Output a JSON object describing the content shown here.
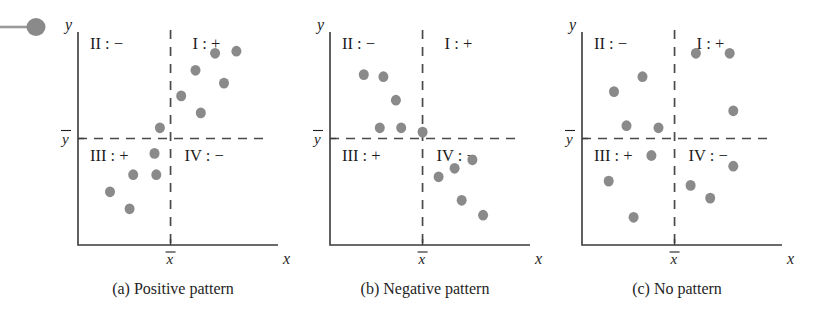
{
  "figure": {
    "dot_color": "#8a8a8a",
    "axis_color": "#3a3a3a",
    "mean_line_color": "#4a4a4a",
    "background": "#ffffff",
    "axis_labels": {
      "x": "x",
      "y": "y"
    },
    "mean_labels": {
      "x": "x",
      "y": "y"
    },
    "quadrant_labels": {
      "q1": "I : +",
      "q2": "II : −",
      "q3": "III : +",
      "q4": "IV : −"
    }
  },
  "chart_data": [
    {
      "type": "scatter",
      "id": "panel-a",
      "title": "(a) Positive pattern",
      "xlabel": "x",
      "ylabel": "y",
      "xlim": [
        0,
        100
      ],
      "ylim": [
        0,
        100
      ],
      "grid": false,
      "legend": "none",
      "mean_x": 52,
      "mean_y": 50,
      "quadrant_signs": {
        "I": "+",
        "II": "−",
        "III": "+",
        "IV": "−"
      },
      "annotations": [
        "I : +",
        "II : −",
        "III : +",
        "IV : −"
      ],
      "points": [
        {
          "x": 46,
          "y": 55
        },
        {
          "x": 58,
          "y": 70
        },
        {
          "x": 69,
          "y": 62
        },
        {
          "x": 66,
          "y": 82
        },
        {
          "x": 77,
          "y": 90
        },
        {
          "x": 89,
          "y": 91
        },
        {
          "x": 82,
          "y": 76
        },
        {
          "x": 43,
          "y": 43
        },
        {
          "x": 31,
          "y": 33
        },
        {
          "x": 44,
          "y": 33
        },
        {
          "x": 18,
          "y": 25
        },
        {
          "x": 29,
          "y": 17
        }
      ]
    },
    {
      "type": "scatter",
      "id": "panel-b",
      "title": "(b) Negative pattern",
      "xlabel": "x",
      "ylabel": "y",
      "xlim": [
        0,
        100
      ],
      "ylim": [
        0,
        100
      ],
      "grid": false,
      "legend": "none",
      "mean_x": 52,
      "mean_y": 50,
      "quadrant_signs": {
        "I": "+",
        "II": "−",
        "III": "+",
        "IV": "−"
      },
      "annotations": [
        "I : +",
        "II : −",
        "III : +",
        "IV : −"
      ],
      "points": [
        {
          "x": 19,
          "y": 80
        },
        {
          "x": 30,
          "y": 79
        },
        {
          "x": 37,
          "y": 68
        },
        {
          "x": 28,
          "y": 55
        },
        {
          "x": 40,
          "y": 55
        },
        {
          "x": 52,
          "y": 53
        },
        {
          "x": 61,
          "y": 32
        },
        {
          "x": 70,
          "y": 36
        },
        {
          "x": 80,
          "y": 40
        },
        {
          "x": 74,
          "y": 21
        },
        {
          "x": 86,
          "y": 14
        }
      ]
    },
    {
      "type": "scatter",
      "id": "panel-c",
      "title": "(c) No pattern",
      "xlabel": "x",
      "ylabel": "y",
      "xlim": [
        0,
        100
      ],
      "ylim": [
        0,
        100
      ],
      "grid": false,
      "legend": "none",
      "mean_x": 52,
      "mean_y": 50,
      "quadrant_signs": {
        "I": "+",
        "II": "−",
        "III": "+",
        "IV": "−"
      },
      "annotations": [
        "I : +",
        "II : −",
        "III : +",
        "IV : −"
      ],
      "points": [
        {
          "x": 18,
          "y": 72
        },
        {
          "x": 34,
          "y": 79
        },
        {
          "x": 25,
          "y": 56
        },
        {
          "x": 43,
          "y": 55
        },
        {
          "x": 64,
          "y": 90
        },
        {
          "x": 83,
          "y": 90
        },
        {
          "x": 85,
          "y": 63
        },
        {
          "x": 39,
          "y": 42
        },
        {
          "x": 15,
          "y": 30
        },
        {
          "x": 29,
          "y": 13
        },
        {
          "x": 61,
          "y": 28
        },
        {
          "x": 72,
          "y": 22
        },
        {
          "x": 85,
          "y": 37
        }
      ]
    }
  ],
  "decorations": {
    "corner_marker": "bullet-pin-icon"
  }
}
